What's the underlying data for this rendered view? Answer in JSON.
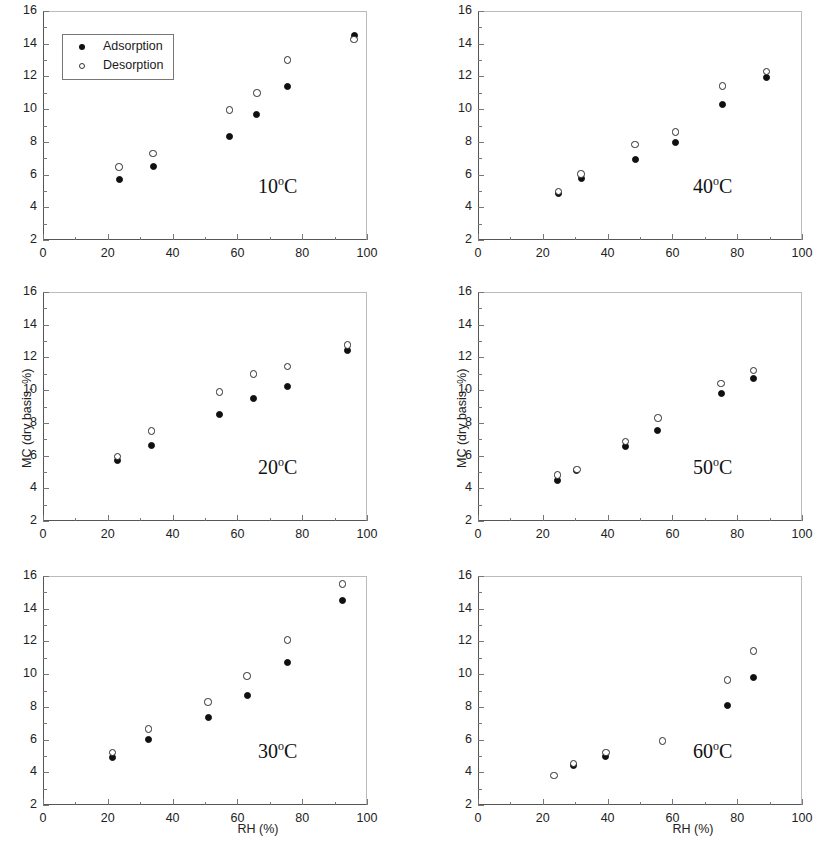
{
  "figure": {
    "axis_title_x": "RH (%)",
    "axis_title_y": "MC (dry basis, %)"
  },
  "legend": {
    "adsorption_label": "Adsorption",
    "desorption_label": "Desorption"
  },
  "axes": {
    "x_ticks": [
      "0",
      "20",
      "40",
      "60",
      "80",
      "100"
    ],
    "y_ticks": [
      "2",
      "4",
      "6",
      "8",
      "10",
      "12",
      "14",
      "16"
    ],
    "xlim": [
      0,
      100
    ],
    "ylim": [
      2,
      16
    ]
  },
  "panels": [
    {
      "temp": "10",
      "unit": "o",
      "scale": "C",
      "label": "10oC"
    },
    {
      "temp": "40",
      "unit": "o",
      "scale": "C",
      "label": "40oC"
    },
    {
      "temp": "20",
      "unit": "o",
      "scale": "C",
      "label": "20oC"
    },
    {
      "temp": "50",
      "unit": "o",
      "scale": "C",
      "label": "50oC"
    },
    {
      "temp": "30",
      "unit": "o",
      "scale": "C",
      "label": "30oC"
    },
    {
      "temp": "60",
      "unit": "o",
      "scale": "C",
      "label": "60oC"
    }
  ],
  "chart_data": [
    {
      "type": "scatter",
      "title": "10oC",
      "xlabel": "RH (%)",
      "ylabel": "MC (dry basis, %)",
      "xlim": [
        0,
        100
      ],
      "ylim": [
        2,
        16
      ],
      "grid": false,
      "legend_position": "upper-left",
      "series": [
        {
          "name": "Adsorption",
          "marker": "filled-circle",
          "points": [
            [
              23.5,
              5.7
            ],
            [
              34.0,
              6.5
            ],
            [
              57.5,
              8.35
            ],
            [
              66.0,
              9.65
            ],
            [
              75.5,
              11.4
            ],
            [
              96.0,
              14.5
            ]
          ]
        },
        {
          "name": "Desorption",
          "marker": "open-circle",
          "points": [
            [
              23.5,
              6.45
            ],
            [
              34.0,
              7.3
            ],
            [
              57.5,
              9.95
            ],
            [
              66.0,
              11.0
            ],
            [
              75.5,
              13.0
            ],
            [
              96.0,
              14.25
            ]
          ]
        }
      ]
    },
    {
      "type": "scatter",
      "title": "40oC",
      "xlabel": "RH (%)",
      "ylabel": "MC (dry basis, %)",
      "xlim": [
        0,
        100
      ],
      "ylim": [
        2,
        16
      ],
      "grid": false,
      "legend_position": "none",
      "series": [
        {
          "name": "Adsorption",
          "marker": "filled-circle",
          "points": [
            [
              24.8,
              4.85
            ],
            [
              31.8,
              5.75
            ],
            [
              48.5,
              6.95
            ],
            [
              61.0,
              7.95
            ],
            [
              75.5,
              10.3
            ],
            [
              89.0,
              11.95
            ]
          ]
        },
        {
          "name": "Desorption",
          "marker": "open-circle",
          "points": [
            [
              24.8,
              4.95
            ],
            [
              31.8,
              6.05
            ],
            [
              48.5,
              7.85
            ],
            [
              61.0,
              8.6
            ],
            [
              75.5,
              11.4
            ],
            [
              89.0,
              12.3
            ]
          ]
        }
      ]
    },
    {
      "type": "scatter",
      "title": "20oC",
      "xlabel": "RH (%)",
      "ylabel": "MC (dry basis, %)",
      "xlim": [
        0,
        100
      ],
      "ylim": [
        2,
        16
      ],
      "grid": false,
      "legend_position": "none",
      "series": [
        {
          "name": "Adsorption",
          "marker": "filled-circle",
          "points": [
            [
              23.0,
              5.7
            ],
            [
              33.5,
              6.6
            ],
            [
              54.5,
              8.5
            ],
            [
              65.0,
              9.5
            ],
            [
              75.5,
              10.2
            ],
            [
              94.0,
              12.45
            ]
          ]
        },
        {
          "name": "Desorption",
          "marker": "open-circle",
          "points": [
            [
              23.0,
              5.95
            ],
            [
              33.5,
              7.5
            ],
            [
              54.5,
              9.9
            ],
            [
              65.0,
              11.0
            ],
            [
              75.5,
              11.45
            ],
            [
              94.0,
              12.75
            ]
          ]
        }
      ]
    },
    {
      "type": "scatter",
      "title": "50oC",
      "xlabel": "RH (%)",
      "ylabel": "MC (dry basis, %)",
      "xlim": [
        0,
        100
      ],
      "ylim": [
        2,
        16
      ],
      "grid": false,
      "legend_position": "none",
      "series": [
        {
          "name": "Adsorption",
          "marker": "filled-circle",
          "points": [
            [
              24.5,
              4.5
            ],
            [
              30.5,
              5.1
            ],
            [
              45.5,
              6.55
            ],
            [
              55.5,
              7.55
            ],
            [
              75.0,
              9.8
            ],
            [
              85.0,
              10.7
            ]
          ]
        },
        {
          "name": "Desorption",
          "marker": "open-circle",
          "points": [
            [
              24.5,
              4.8
            ],
            [
              30.5,
              5.15
            ],
            [
              45.5,
              6.85
            ],
            [
              55.5,
              8.3
            ],
            [
              75.0,
              10.4
            ],
            [
              85.0,
              11.2
            ]
          ]
        }
      ]
    },
    {
      "type": "scatter",
      "title": "30oC",
      "xlabel": "RH (%)",
      "ylabel": "MC (dry basis, %)",
      "xlim": [
        0,
        100
      ],
      "ylim": [
        2,
        16
      ],
      "grid": false,
      "legend_position": "none",
      "series": [
        {
          "name": "Adsorption",
          "marker": "filled-circle",
          "points": [
            [
              21.5,
              4.9
            ],
            [
              32.5,
              6.0
            ],
            [
              51.0,
              7.35
            ],
            [
              63.0,
              8.7
            ],
            [
              75.5,
              10.7
            ],
            [
              92.5,
              14.5
            ]
          ]
        },
        {
          "name": "Desorption",
          "marker": "open-circle",
          "points": [
            [
              21.5,
              5.2
            ],
            [
              32.5,
              6.65
            ],
            [
              51.0,
              8.3
            ],
            [
              63.0,
              9.9
            ],
            [
              75.5,
              12.1
            ],
            [
              92.5,
              15.5
            ]
          ]
        }
      ]
    },
    {
      "type": "scatter",
      "title": "60oC",
      "xlabel": "RH (%)",
      "ylabel": "MC (dry basis, %)",
      "xlim": [
        0,
        100
      ],
      "ylim": [
        2,
        16
      ],
      "grid": false,
      "legend_position": "none",
      "series": [
        {
          "name": "Adsorption",
          "marker": "filled-circle",
          "points": [
            [
              29.5,
              4.4
            ],
            [
              39.5,
              4.95
            ],
            [
              77.0,
              8.1
            ],
            [
              85.0,
              9.8
            ]
          ]
        },
        {
          "name": "Desorption",
          "marker": "open-circle",
          "points": [
            [
              23.5,
              3.8
            ],
            [
              29.5,
              4.55
            ],
            [
              39.5,
              5.2
            ],
            [
              57.0,
              5.9
            ],
            [
              77.0,
              9.65
            ],
            [
              85.0,
              11.4
            ]
          ]
        }
      ]
    }
  ]
}
